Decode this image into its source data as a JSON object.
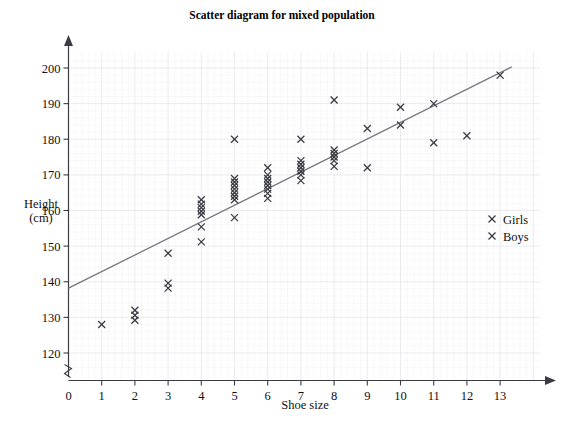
{
  "chart_data": {
    "type": "scatter",
    "title": "Scatter diagram for mixed population",
    "xlabel": "Shoe size",
    "ylabel_line1": "Height",
    "ylabel_line2": "(cm)",
    "xlim": [
      0,
      13.6
    ],
    "ylim": [
      115,
      203
    ],
    "xticks": [
      0,
      1,
      2,
      3,
      4,
      5,
      6,
      7,
      8,
      9,
      10,
      11,
      12,
      13
    ],
    "yticks": [
      120,
      130,
      140,
      150,
      160,
      170,
      180,
      190,
      200
    ],
    "grid": true,
    "axis_break_x": false,
    "axis_break_y": true,
    "legend": {
      "position": "right-middle",
      "entries": [
        {
          "label": "Girls",
          "marker": "x",
          "color": "#3a3a42"
        },
        {
          "label": "Boys",
          "marker": "x",
          "color": "#3a3a42"
        }
      ]
    },
    "trendline": {
      "label": "line of best fit",
      "color": "#77777f",
      "x": [
        0,
        13.35
      ],
      "y": [
        138.2,
        200.3
      ]
    },
    "marker": {
      "shape": "x",
      "color": "#3a3a42",
      "size": 7
    },
    "points": [
      {
        "x": 1,
        "y": 128
      },
      {
        "x": 2,
        "y": 132
      },
      {
        "x": 2,
        "y": 130.6
      },
      {
        "x": 2,
        "y": 129.2
      },
      {
        "x": 3,
        "y": 148
      },
      {
        "x": 3,
        "y": 139.6
      },
      {
        "x": 3,
        "y": 138.2
      },
      {
        "x": 4,
        "y": 163
      },
      {
        "x": 4,
        "y": 161.8
      },
      {
        "x": 4,
        "y": 160.8
      },
      {
        "x": 4,
        "y": 159.8
      },
      {
        "x": 4,
        "y": 158.8
      },
      {
        "x": 4,
        "y": 155.4
      },
      {
        "x": 4,
        "y": 151.2
      },
      {
        "x": 5,
        "y": 180
      },
      {
        "x": 5,
        "y": 169
      },
      {
        "x": 5,
        "y": 168
      },
      {
        "x": 5,
        "y": 167
      },
      {
        "x": 5,
        "y": 166
      },
      {
        "x": 5,
        "y": 165
      },
      {
        "x": 5,
        "y": 164
      },
      {
        "x": 5,
        "y": 163
      },
      {
        "x": 5,
        "y": 158
      },
      {
        "x": 6,
        "y": 172
      },
      {
        "x": 6,
        "y": 170
      },
      {
        "x": 6,
        "y": 169
      },
      {
        "x": 6,
        "y": 168
      },
      {
        "x": 6,
        "y": 167
      },
      {
        "x": 6,
        "y": 166
      },
      {
        "x": 6,
        "y": 164.8
      },
      {
        "x": 6,
        "y": 163.4
      },
      {
        "x": 7,
        "y": 180
      },
      {
        "x": 7,
        "y": 174
      },
      {
        "x": 7,
        "y": 173
      },
      {
        "x": 7,
        "y": 172
      },
      {
        "x": 7,
        "y": 171
      },
      {
        "x": 7,
        "y": 170
      },
      {
        "x": 7,
        "y": 168.4
      },
      {
        "x": 8,
        "y": 191
      },
      {
        "x": 8,
        "y": 177
      },
      {
        "x": 8,
        "y": 176
      },
      {
        "x": 8,
        "y": 175
      },
      {
        "x": 8,
        "y": 174
      },
      {
        "x": 8,
        "y": 172.4
      },
      {
        "x": 9,
        "y": 183
      },
      {
        "x": 9,
        "y": 172
      },
      {
        "x": 10,
        "y": 189
      },
      {
        "x": 10,
        "y": 184
      },
      {
        "x": 11,
        "y": 190
      },
      {
        "x": 11,
        "y": 179
      },
      {
        "x": 12,
        "y": 181
      },
      {
        "x": 13,
        "y": 198
      }
    ]
  }
}
